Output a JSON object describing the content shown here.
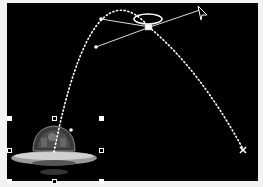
{
  "scene": {
    "background_color": "#000000",
    "path_color": "#ffffff",
    "object": {
      "name": "ufo",
      "selected": true
    },
    "motion_path": {
      "style": "dotted",
      "start_marker": "start-point",
      "end_marker": "x-end-marker"
    },
    "control_point": {
      "type": "bezier",
      "has_tangent_handles": true
    },
    "rotation_handle": "halo-ellipse",
    "pointer": "arrow-cursor"
  }
}
